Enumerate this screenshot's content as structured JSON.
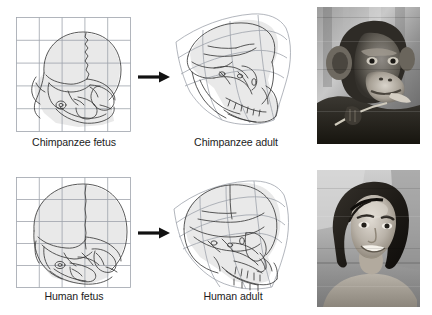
{
  "figure": {
    "background_color": "#ffffff",
    "width": 432,
    "height": 315
  },
  "colors": {
    "grid_line": "#9aa0a8",
    "skull_outline": "#3b3b3b",
    "skull_fill": "#e8e8e8",
    "arrow": "#111111",
    "caption_text": "#1c1c1c",
    "photo_border": "#b4b4b4"
  },
  "rows": [
    {
      "id": "chimpanzee",
      "fetus": {
        "label": "Chimpanzee fetus",
        "grid_columns": 5,
        "grid_rows": 5,
        "grid_type": "rectilinear"
      },
      "adult": {
        "label": "Chimpanzee adult",
        "grid_columns": 4,
        "grid_rows": 4,
        "grid_type": "deformed"
      },
      "arrow": {
        "direction": "right",
        "meaning": "transforms-into"
      },
      "photo": {
        "subject": "chimpanzee-adult-portrait",
        "type": "grayscale-photograph"
      }
    },
    {
      "id": "human",
      "fetus": {
        "label": "Human fetus",
        "grid_columns": 5,
        "grid_rows": 5,
        "grid_type": "rectilinear"
      },
      "adult": {
        "label": "Human adult",
        "grid_columns": 4,
        "grid_rows": 4,
        "grid_type": "deformed"
      },
      "arrow": {
        "direction": "right",
        "meaning": "transforms-into"
      },
      "photo": {
        "subject": "human-woman-portrait",
        "type": "grayscale-photograph"
      }
    }
  ]
}
